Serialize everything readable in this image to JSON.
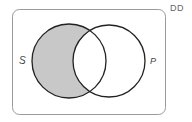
{
  "diagram": {
    "type": "venn",
    "corner_label": "DD",
    "sets": [
      {
        "label": "S",
        "cx": 69,
        "cy": 61,
        "r": 37
      },
      {
        "label": "P",
        "cx": 109,
        "cy": 61,
        "r": 36
      }
    ],
    "shaded_region": "S only (S minus P)",
    "colors": {
      "shade": "#c8c8c8",
      "circle_stroke": "#222222",
      "frame_stroke": "#9a9a9a"
    }
  }
}
